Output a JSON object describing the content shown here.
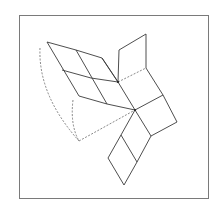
{
  "figure": {
    "colors": {
      "line": "#3a3a3a",
      "dashed": "#555555",
      "frame": "#7a7a7a",
      "background": "#ffffff"
    }
  }
}
